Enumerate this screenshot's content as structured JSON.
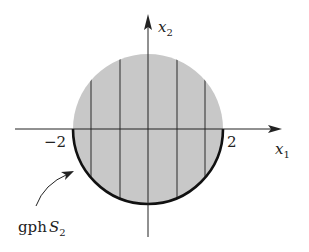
{
  "figure": {
    "axes": {
      "x_label": "x",
      "x_subscript": "1",
      "y_label": "x",
      "y_subscript": "2"
    },
    "ticks": {
      "left": "−2",
      "right": "2"
    },
    "annotation": {
      "prefix": "gph",
      "symbol": "S",
      "subscript": "2"
    },
    "colors": {
      "disk_fill": "#c8c8c8",
      "lines": "#2a2a2a",
      "boundary": "#111111"
    }
  }
}
